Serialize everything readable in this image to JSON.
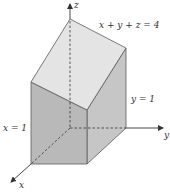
{
  "diagram": {
    "type": "3d-solid-region",
    "axes": {
      "x_label": "x",
      "y_label": "y",
      "z_label": "z"
    },
    "plane_labels": {
      "top_plane": "x + y + z = 4",
      "right_plane": "y = 1",
      "front_plane": "x = 1"
    },
    "colors": {
      "top_face": "#e4e4e4",
      "front_face": "#b9b9b9",
      "side_face": "#c6c6c6",
      "edge": "#5a5a5a",
      "axis": "#333333",
      "background": "#ffffff"
    }
  }
}
